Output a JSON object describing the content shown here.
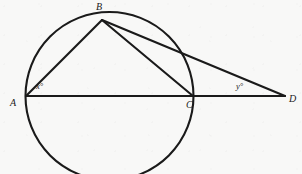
{
  "figure": {
    "background_color": "#f8f8f7",
    "stroke_color": "#1a1a1a",
    "width": 302,
    "height": 174
  },
  "circle": {
    "name": "main-circle",
    "center_x": 109.5,
    "center_y": 96,
    "radius": 84,
    "stroke_width": 2.1
  },
  "points": {
    "A": {
      "label": "A",
      "x": 26,
      "y": 96
    },
    "B": {
      "label": "B",
      "x": 102,
      "y": 20
    },
    "C": {
      "label": "C",
      "x": 193,
      "y": 96
    },
    "D": {
      "label": "D",
      "x": 285,
      "y": 96
    }
  },
  "segments": [
    {
      "name": "segment-AD",
      "from": "A",
      "to": "D",
      "x1": 26,
      "y1": 96,
      "x2": 285,
      "y2": 96,
      "stroke_width": 2.1
    },
    {
      "name": "segment-AB",
      "from": "A",
      "to": "B",
      "x1": 26,
      "y1": 96,
      "x2": 102,
      "y2": 20,
      "stroke_width": 2.1
    },
    {
      "name": "segment-BC",
      "from": "B",
      "to": "C",
      "x1": 102,
      "y1": 20,
      "x2": 193,
      "y2": 96,
      "stroke_width": 2.1
    },
    {
      "name": "segment-BD",
      "from": "B",
      "to": "D",
      "x1": 102,
      "y1": 20,
      "x2": 285,
      "y2": 96,
      "stroke_width": 2.1
    }
  ],
  "angles": {
    "at_A": {
      "label": "x°",
      "vertex": "A",
      "x": 36,
      "y": 82
    },
    "at_D": {
      "label": "y°",
      "vertex": "D",
      "x": 236,
      "y": 82
    }
  },
  "chart_data": {
    "type": "diagram",
    "geometry": {
      "circle": {
        "center": [
          109.5,
          96
        ],
        "radius": 84
      },
      "points": [
        {
          "id": "A",
          "coords": [
            26,
            96
          ],
          "on_circle": true,
          "note": "left end of diameter AC"
        },
        {
          "id": "B",
          "coords": [
            102,
            20
          ],
          "on_circle": true,
          "note": "apex on upper arc"
        },
        {
          "id": "C",
          "coords": [
            193,
            96
          ],
          "on_circle": true,
          "note": "right end of diameter AC"
        },
        {
          "id": "D",
          "coords": [
            285,
            96
          ],
          "on_circle": false,
          "note": "external point on ray AC extended"
        }
      ],
      "lines": [
        {
          "id": "AD",
          "endpoints": [
            "A",
            "D"
          ],
          "note": "straight line through A, C and D (AC is a diameter)"
        },
        {
          "id": "AB",
          "endpoints": [
            "A",
            "B"
          ],
          "note": "chord"
        },
        {
          "id": "BC",
          "endpoints": [
            "B",
            "C"
          ],
          "note": "chord"
        },
        {
          "id": "BD",
          "endpoints": [
            "B",
            "D"
          ],
          "note": "secant from B through the circle to D"
        }
      ],
      "marked_angles": [
        {
          "id": "x",
          "label": "x°",
          "vertex": "A",
          "rays": [
            "AB",
            "AD"
          ]
        },
        {
          "id": "y",
          "label": "y°",
          "vertex": "D",
          "rays": [
            "DB",
            "DA"
          ]
        }
      ]
    },
    "labels": [
      "A",
      "B",
      "C",
      "D",
      "x°",
      "y°"
    ],
    "xlabel": "",
    "ylabel": ""
  }
}
